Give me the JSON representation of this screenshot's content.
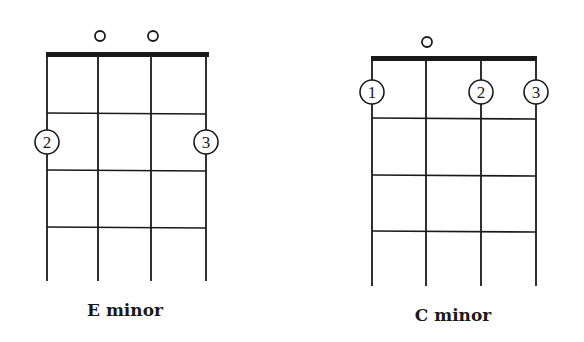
{
  "colors": {
    "ink": "#1a1a1a",
    "background": "#ffffff"
  },
  "diagrams": [
    {
      "name": "E minor",
      "label": "E minor",
      "strings_x": [
        47,
        98,
        151,
        206
      ],
      "nut": {
        "x1": 47,
        "x2": 209,
        "y": 52,
        "height": 5
      },
      "frets_y": [
        113,
        170,
        227
      ],
      "string_bottom_y": 281,
      "open_strings": [
        {
          "string": 2,
          "x": 100,
          "y": 36
        },
        {
          "string": 3,
          "x": 153,
          "y": 36
        }
      ],
      "fingers": [
        {
          "string": 1,
          "fret": 2,
          "finger": "2",
          "x": 47,
          "y": 142
        },
        {
          "string": 4,
          "fret": 2,
          "finger": "3",
          "x": 206,
          "y": 142
        }
      ],
      "label_pos": {
        "x": 125,
        "y": 300
      }
    },
    {
      "name": "C minor",
      "label": "C minor",
      "strings_x": [
        372,
        426,
        481,
        536
      ],
      "nut": {
        "x1": 372,
        "x2": 537,
        "y": 56,
        "height": 5
      },
      "frets_y": [
        118,
        175,
        231
      ],
      "string_bottom_y": 286,
      "open_strings": [
        {
          "string": 2,
          "x": 427,
          "y": 42
        }
      ],
      "fingers": [
        {
          "string": 1,
          "fret": 1,
          "finger": "1",
          "x": 372,
          "y": 92
        },
        {
          "string": 3,
          "fret": 1,
          "finger": "2",
          "x": 481,
          "y": 92
        },
        {
          "string": 4,
          "fret": 1,
          "finger": "3",
          "x": 536,
          "y": 92
        }
      ],
      "label_pos": {
        "x": 453,
        "y": 305
      }
    }
  ]
}
